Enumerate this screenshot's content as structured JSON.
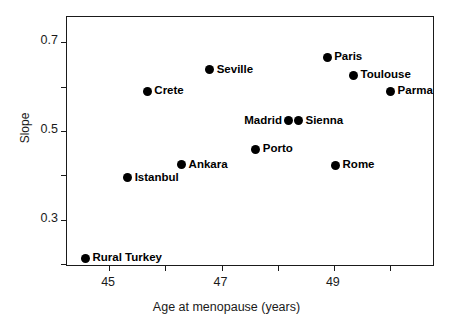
{
  "chart_data": {
    "type": "scatter",
    "title": "",
    "xlabel": "Age at menopause (years)",
    "ylabel": "Slope",
    "xlim": [
      44.25,
      50.8
    ],
    "ylim": [
      0.193,
      0.757
    ],
    "grid": false,
    "legend": "none",
    "xticks": [
      45,
      46,
      47,
      48,
      49,
      50
    ],
    "xticklabels": [
      "45",
      "",
      "47",
      "",
      "49",
      ""
    ],
    "yticks": [
      0.7,
      0.6,
      0.5,
      0.4,
      0.3,
      0.2
    ],
    "yticklabels": [
      "0.7",
      "",
      "0.5",
      "",
      "0.3",
      ""
    ],
    "points": [
      {
        "label": "Rural Turkey",
        "x": 44.58,
        "y": 0.213,
        "label_side": "right"
      },
      {
        "label": "Istanbul",
        "x": 45.33,
        "y": 0.394,
        "label_side": "right"
      },
      {
        "label": "Crete",
        "x": 45.68,
        "y": 0.59,
        "label_side": "right"
      },
      {
        "label": "Ankara",
        "x": 46.29,
        "y": 0.424,
        "label_side": "right"
      },
      {
        "label": "Seville",
        "x": 46.79,
        "y": 0.638,
        "label_side": "right"
      },
      {
        "label": "Porto",
        "x": 47.61,
        "y": 0.459,
        "label_side": "right"
      },
      {
        "label": "Madrid",
        "x": 48.2,
        "y": 0.523,
        "label_side": "left"
      },
      {
        "label": "Sienna",
        "x": 48.37,
        "y": 0.523,
        "label_side": "right"
      },
      {
        "label": "Paris",
        "x": 48.88,
        "y": 0.666,
        "label_side": "right"
      },
      {
        "label": "Rome",
        "x": 49.03,
        "y": 0.422,
        "label_side": "right"
      },
      {
        "label": "Toulouse",
        "x": 49.35,
        "y": 0.626,
        "label_side": "right"
      },
      {
        "label": "Parma",
        "x": 50.01,
        "y": 0.59,
        "label_side": "right"
      }
    ],
    "marker_color": "#000000",
    "axis_color": "#1a1a1a"
  }
}
